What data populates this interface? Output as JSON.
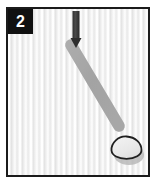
{
  "panel": {
    "step_number": "2",
    "figure_type": "instructional-illustration",
    "background_description": "light gray vertically streaked surface",
    "colors": {
      "frame_border": "#1b1b1b",
      "badge_background": "#111111",
      "badge_text": "#ffffff",
      "background_light": "#f4f4f4",
      "background_mid": "#e3e3e3",
      "arrow": "#3a3a3a",
      "stick": "#a9a9a9",
      "stick_edge": "#9a9a9a",
      "object_outline": "#1f1f1f",
      "object_fill": "#ededed",
      "shadow": "#b4b4b4"
    }
  },
  "elements": {
    "arrow": {
      "name": "downward-arrow",
      "shaft_x": 68,
      "shaft_top_y": 3,
      "shaft_bottom_y": 30,
      "tip_y": 38,
      "width": 7,
      "color": "#3a3a3a"
    },
    "stick": {
      "name": "diagonal-tool",
      "start_x": 62,
      "start_y": 35,
      "end_x": 112,
      "end_y": 118,
      "thickness": 11,
      "color": "#a9a9a9"
    },
    "object": {
      "name": "egg-shaped-object",
      "center_x": 118,
      "center_y": 139,
      "radius_x": 15,
      "radius_y": 11,
      "outline_color": "#1f1f1f",
      "fill_color": "#ededed"
    },
    "shadow": {
      "name": "object-shadow",
      "center_x": 121,
      "center_y": 146,
      "radius_x": 15,
      "radius_y": 10,
      "color": "#b4b4b4"
    }
  }
}
